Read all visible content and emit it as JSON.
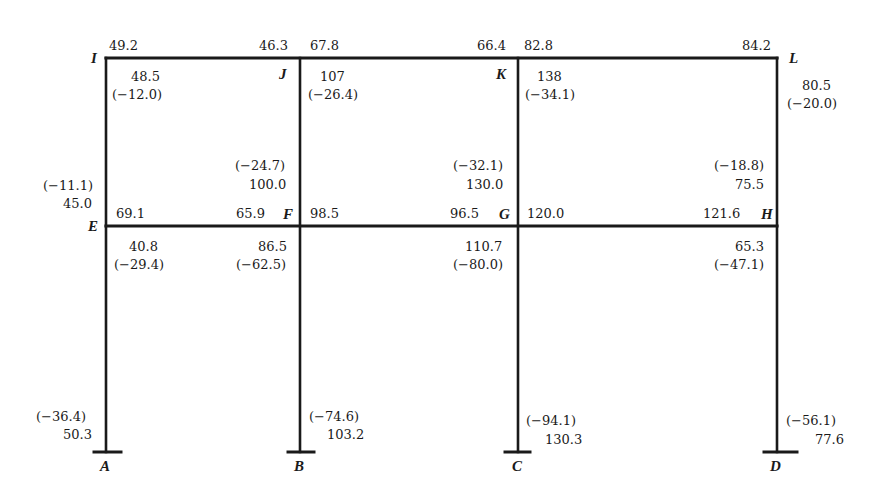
{
  "diagram": {
    "type": "two-story three-bay rigid frame moment diagram",
    "colors": {
      "member": "#1a1a1a",
      "background": "#ffffff",
      "text": "#1a1a1a"
    },
    "nodes": {
      "A": "A",
      "B": "B",
      "C": "C",
      "D": "D",
      "E": "E",
      "F": "F",
      "G": "G",
      "H": "H",
      "I": "I",
      "J": "J",
      "K": "K",
      "L": "L"
    },
    "roof_beams": {
      "IJ": {
        "left": "49.2",
        "right": "46.3",
        "mid_top": "48.5",
        "mid_bottom": "(−12.0)"
      },
      "JK": {
        "left": "67.8",
        "right": "66.4",
        "mid_top": "107",
        "mid_bottom": "(−26.4)"
      },
      "KL": {
        "left": "82.8",
        "right": "84.2",
        "mid_top": "138",
        "mid_bottom": "(−34.1)"
      }
    },
    "upper_columns": {
      "EI": {
        "top": "80.5",
        "top_paren": "(−20.0)",
        "bottom_paren": "(−11.1)",
        "bottom": "45.0"
      },
      "FJ": {
        "bottom_paren": "(−24.7)",
        "bottom": "100.0"
      },
      "GK": {
        "bottom_paren": "(−32.1)",
        "bottom": "130.0"
      },
      "HL": {
        "bottom_paren": "(−18.8)",
        "bottom": "75.5"
      }
    },
    "floor_beams": {
      "EF": {
        "left": "69.1",
        "right": "65.9"
      },
      "FG": {
        "left": "98.5",
        "right": "96.5"
      },
      "GH": {
        "left": "120.0",
        "right": "121.6"
      }
    },
    "lower_columns": {
      "AE": {
        "top": "40.8",
        "top_paren": "(−29.4)",
        "bottom_paren": "(−36.4)",
        "bottom": "50.3"
      },
      "BF": {
        "top": "86.5",
        "top_paren": "(−62.5)",
        "bottom_paren": "(−74.6)",
        "bottom": "103.2"
      },
      "CG": {
        "top": "110.7",
        "top_paren": "(−80.0)",
        "bottom_paren": "(−94.1)",
        "bottom": "130.3"
      },
      "DH": {
        "top": "65.3",
        "top_paren": "(−47.1)",
        "bottom_paren": "(−56.1)",
        "bottom": "77.6"
      }
    }
  }
}
